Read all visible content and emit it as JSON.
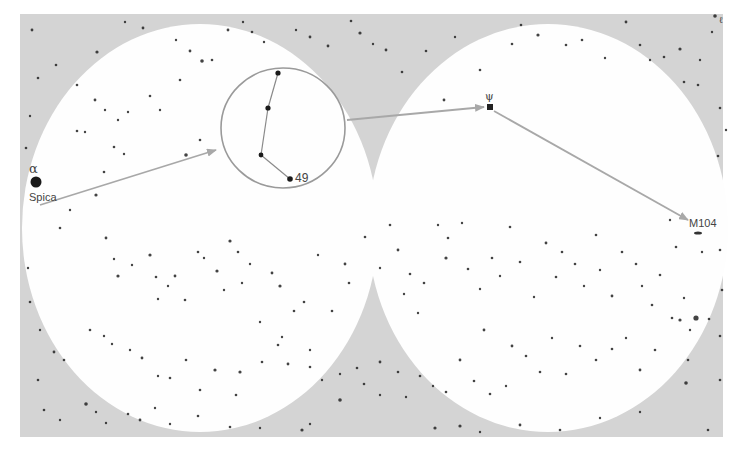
{
  "map": {
    "background_color": "#ffffff",
    "sky_panel_color": "#d4d4d4",
    "field_color": "#fefefe",
    "star_color": "#222222",
    "arrow_color": "#a8a8a8",
    "eyepiece_ring_color": "#9a9a9a",
    "panel": {
      "x": 20,
      "y": 14,
      "w": 703,
      "h": 423
    },
    "fields": [
      {
        "name": "left-finder-field",
        "cx": 200,
        "cy": 228,
        "rx": 178,
        "ry": 204
      },
      {
        "name": "right-finder-field",
        "cx": 548,
        "cy": 228,
        "rx": 180,
        "ry": 204
      }
    ],
    "eyepiece": {
      "cx": 283,
      "cy": 128,
      "rx": 62,
      "ry": 60
    },
    "labels": {
      "alpha": "α",
      "spica": "Spica",
      "star49": "49",
      "psi": "ψ",
      "m104": "M104",
      "corner": "ℓ"
    },
    "key_stars": [
      {
        "name": "spica",
        "x": 36,
        "y": 182,
        "r": 5.5
      },
      {
        "name": "psi-star",
        "x": 490,
        "y": 107,
        "r": 3.2
      },
      {
        "name": "asterism-star-1",
        "x": 278,
        "y": 73,
        "r": 2.6
      },
      {
        "name": "asterism-star-2",
        "x": 268,
        "y": 108,
        "r": 2.6
      },
      {
        "name": "asterism-star-3",
        "x": 261,
        "y": 155,
        "r": 2.4
      },
      {
        "name": "star-49",
        "x": 290,
        "y": 179,
        "r": 2.8
      },
      {
        "name": "m104-galaxy",
        "x": 698,
        "y": 233,
        "r": 2.2
      }
    ],
    "asterism_lines": [
      [
        278,
        73,
        268,
        108
      ],
      [
        268,
        108,
        261,
        155
      ],
      [
        261,
        155,
        290,
        179
      ]
    ],
    "arrows": [
      {
        "name": "arrow-spica-to-eyepiece",
        "x1": 40,
        "y1": 205,
        "x2": 216,
        "y2": 150
      },
      {
        "name": "arrow-eyepiece-to-psi",
        "x1": 347,
        "y1": 120,
        "x2": 484,
        "y2": 107
      },
      {
        "name": "arrow-psi-to-m104",
        "x1": 494,
        "y1": 111,
        "x2": 688,
        "y2": 220
      }
    ],
    "stars": [
      [
        32,
        30,
        1.4
      ],
      [
        97,
        52,
        1.6
      ],
      [
        125,
        22,
        1.2
      ],
      [
        143,
        28,
        1.4
      ],
      [
        176,
        40,
        1.2
      ],
      [
        190,
        51,
        1.4
      ],
      [
        202,
        61,
        1.8
      ],
      [
        212,
        60,
        1.3
      ],
      [
        228,
        30,
        1.4
      ],
      [
        243,
        22,
        1.2
      ],
      [
        252,
        32,
        1.3
      ],
      [
        264,
        42,
        1.2
      ],
      [
        296,
        30,
        1.2
      ],
      [
        310,
        37,
        1.4
      ],
      [
        328,
        46,
        1.4
      ],
      [
        351,
        21,
        1.3
      ],
      [
        360,
        33,
        1.6
      ],
      [
        373,
        44,
        1.2
      ],
      [
        386,
        50,
        1.4
      ],
      [
        402,
        72,
        1.3
      ],
      [
        426,
        51,
        1.3
      ],
      [
        444,
        100,
        1.4
      ],
      [
        455,
        37,
        1.2
      ],
      [
        480,
        70,
        1.3
      ],
      [
        512,
        44,
        1.3
      ],
      [
        521,
        25,
        1.3
      ],
      [
        538,
        35,
        1.6
      ],
      [
        566,
        45,
        1.3
      ],
      [
        582,
        40,
        1.3
      ],
      [
        605,
        58,
        1.2
      ],
      [
        626,
        22,
        1.4
      ],
      [
        640,
        45,
        1.3
      ],
      [
        650,
        60,
        1.2
      ],
      [
        664,
        57,
        1.3
      ],
      [
        680,
        49,
        1.6
      ],
      [
        684,
        82,
        1.3
      ],
      [
        698,
        85,
        1.3
      ],
      [
        700,
        60,
        1.2
      ],
      [
        712,
        32,
        1.2
      ],
      [
        715,
        16,
        1.8
      ],
      [
        56,
        65,
        1.3
      ],
      [
        77,
        85,
        1.3
      ],
      [
        95,
        100,
        1.4
      ],
      [
        105,
        110,
        1.2
      ],
      [
        118,
        120,
        1.2
      ],
      [
        128,
        112,
        1.2
      ],
      [
        150,
        96,
        1.3
      ],
      [
        160,
        110,
        1.2
      ],
      [
        180,
        80,
        1.3
      ],
      [
        186,
        155,
        1.8
      ],
      [
        200,
        140,
        1.3
      ],
      [
        96,
        195,
        1.6
      ],
      [
        77,
        131,
        1.3
      ],
      [
        85,
        132,
        1.2
      ],
      [
        104,
        172,
        1.3
      ],
      [
        114,
        147,
        1.3
      ],
      [
        124,
        154,
        1.2
      ],
      [
        70,
        210,
        1.2
      ],
      [
        60,
        228,
        1.3
      ],
      [
        106,
        238,
        1.4
      ],
      [
        114,
        259,
        1.2
      ],
      [
        118,
        276,
        1.6
      ],
      [
        132,
        265,
        1.2
      ],
      [
        150,
        255,
        1.6
      ],
      [
        156,
        277,
        1.3
      ],
      [
        158,
        299,
        1.2
      ],
      [
        168,
        286,
        1.2
      ],
      [
        175,
        276,
        1.4
      ],
      [
        185,
        300,
        1.3
      ],
      [
        198,
        252,
        1.3
      ],
      [
        204,
        258,
        1.2
      ],
      [
        217,
        271,
        1.6
      ],
      [
        224,
        290,
        1.2
      ],
      [
        230,
        241,
        1.6
      ],
      [
        238,
        252,
        1.3
      ],
      [
        242,
        283,
        1.2
      ],
      [
        250,
        264,
        1.2
      ],
      [
        260,
        322,
        1.2
      ],
      [
        272,
        273,
        1.4
      ],
      [
        280,
        286,
        1.6
      ],
      [
        282,
        337,
        1.2
      ],
      [
        294,
        311,
        1.3
      ],
      [
        304,
        302,
        1.3
      ],
      [
        310,
        350,
        1.2
      ],
      [
        318,
        255,
        1.2
      ],
      [
        332,
        311,
        1.3
      ],
      [
        345,
        264,
        1.4
      ],
      [
        349,
        283,
        1.3
      ],
      [
        365,
        237,
        1.3
      ],
      [
        380,
        268,
        1.2
      ],
      [
        390,
        225,
        1.3
      ],
      [
        398,
        250,
        1.4
      ],
      [
        404,
        294,
        1.2
      ],
      [
        410,
        274,
        1.3
      ],
      [
        418,
        313,
        1.2
      ],
      [
        424,
        283,
        1.3
      ],
      [
        438,
        225,
        1.2
      ],
      [
        446,
        258,
        1.6
      ],
      [
        448,
        238,
        1.3
      ],
      [
        462,
        223,
        1.2
      ],
      [
        468,
        269,
        1.3
      ],
      [
        480,
        289,
        1.2
      ],
      [
        484,
        330,
        1.4
      ],
      [
        492,
        258,
        1.3
      ],
      [
        500,
        276,
        1.2
      ],
      [
        510,
        227,
        1.3
      ],
      [
        520,
        262,
        1.3
      ],
      [
        534,
        297,
        1.2
      ],
      [
        546,
        243,
        1.4
      ],
      [
        556,
        277,
        1.3
      ],
      [
        562,
        252,
        1.3
      ],
      [
        575,
        264,
        1.3
      ],
      [
        584,
        286,
        1.2
      ],
      [
        596,
        235,
        1.3
      ],
      [
        600,
        270,
        1.2
      ],
      [
        612,
        296,
        1.4
      ],
      [
        622,
        252,
        1.3
      ],
      [
        636,
        264,
        1.3
      ],
      [
        642,
        286,
        1.2
      ],
      [
        652,
        305,
        1.3
      ],
      [
        660,
        275,
        1.3
      ],
      [
        670,
        220,
        1.2
      ],
      [
        676,
        247,
        1.3
      ],
      [
        680,
        320,
        1.6
      ],
      [
        684,
        298,
        1.2
      ],
      [
        690,
        330,
        1.2
      ],
      [
        702,
        252,
        1.2
      ],
      [
        709,
        319,
        1.3
      ],
      [
        90,
        330,
        1.3
      ],
      [
        104,
        336,
        1.2
      ],
      [
        112,
        344,
        1.2
      ],
      [
        130,
        350,
        1.2
      ],
      [
        142,
        358,
        1.4
      ],
      [
        158,
        376,
        1.2
      ],
      [
        170,
        378,
        1.3
      ],
      [
        186,
        360,
        1.3
      ],
      [
        200,
        390,
        1.3
      ],
      [
        215,
        370,
        1.6
      ],
      [
        236,
        395,
        1.3
      ],
      [
        240,
        372,
        1.6
      ],
      [
        262,
        362,
        1.3
      ],
      [
        278,
        345,
        1.3
      ],
      [
        288,
        364,
        1.4
      ],
      [
        310,
        367,
        1.3
      ],
      [
        322,
        380,
        1.2
      ],
      [
        340,
        374,
        1.2
      ],
      [
        357,
        368,
        1.3
      ],
      [
        380,
        362,
        1.4
      ],
      [
        398,
        372,
        1.3
      ],
      [
        420,
        376,
        1.3
      ],
      [
        433,
        386,
        1.2
      ],
      [
        446,
        392,
        1.3
      ],
      [
        460,
        360,
        1.4
      ],
      [
        474,
        381,
        1.3
      ],
      [
        490,
        394,
        1.3
      ],
      [
        506,
        386,
        1.2
      ],
      [
        512,
        346,
        1.4
      ],
      [
        526,
        356,
        1.3
      ],
      [
        540,
        372,
        1.3
      ],
      [
        552,
        338,
        1.2
      ],
      [
        566,
        374,
        1.3
      ],
      [
        580,
        346,
        1.3
      ],
      [
        596,
        360,
        1.3
      ],
      [
        612,
        349,
        1.3
      ],
      [
        626,
        338,
        1.2
      ],
      [
        640,
        370,
        1.4
      ],
      [
        655,
        350,
        1.3
      ],
      [
        672,
        318,
        1.3
      ],
      [
        696,
        318,
        2.6
      ],
      [
        688,
        360,
        1.3
      ],
      [
        38,
        78,
        1.3
      ],
      [
        30,
        116,
        1.2
      ],
      [
        26,
        148,
        1.3
      ],
      [
        28,
        268,
        1.2
      ],
      [
        30,
        302,
        1.3
      ],
      [
        40,
        330,
        1.2
      ],
      [
        54,
        352,
        1.4
      ],
      [
        64,
        360,
        1.3
      ],
      [
        38,
        380,
        1.3
      ],
      [
        44,
        410,
        1.3
      ],
      [
        60,
        420,
        1.2
      ],
      [
        86,
        404,
        1.8
      ],
      [
        96,
        412,
        1.2
      ],
      [
        106,
        423,
        1.2
      ],
      [
        128,
        414,
        1.3
      ],
      [
        140,
        420,
        1.4
      ],
      [
        155,
        408,
        1.2
      ],
      [
        170,
        424,
        1.2
      ],
      [
        198,
        416,
        1.3
      ],
      [
        230,
        427,
        1.3
      ],
      [
        260,
        428,
        1.2
      ],
      [
        302,
        430,
        1.6
      ],
      [
        310,
        424,
        1.2
      ],
      [
        340,
        400,
        1.8
      ],
      [
        364,
        384,
        1.3
      ],
      [
        380,
        395,
        1.2
      ],
      [
        406,
        397,
        1.2
      ],
      [
        435,
        428,
        1.6
      ],
      [
        460,
        426,
        1.6
      ],
      [
        480,
        432,
        1.2
      ],
      [
        520,
        425,
        1.4
      ],
      [
        560,
        430,
        1.3
      ],
      [
        600,
        418,
        1.2
      ],
      [
        640,
        412,
        1.2
      ],
      [
        686,
        383,
        1.8
      ],
      [
        720,
        380,
        1.3
      ],
      [
        708,
        430,
        1.3
      ],
      [
        720,
        250,
        1.3
      ],
      [
        722,
        290,
        1.3
      ],
      [
        720,
        336,
        1.3
      ],
      [
        718,
        156,
        1.3
      ],
      [
        720,
        108,
        1.3
      ],
      [
        726,
        130,
        1.2
      ]
    ]
  }
}
